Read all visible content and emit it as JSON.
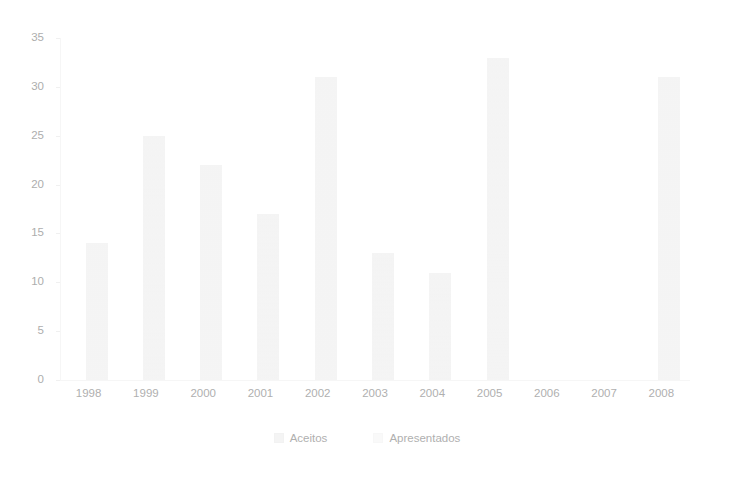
{
  "chart_data": {
    "type": "bar",
    "title": "",
    "subtitle": "",
    "xlabel": "",
    "ylabel": "",
    "categories": [
      "1998",
      "1999",
      "2000",
      "2001",
      "2002",
      "2003",
      "2004",
      "2005",
      "2006",
      "2007",
      "2008"
    ],
    "series": [
      {
        "name": "Aceitos",
        "color": "#f0f0f0",
        "values": [
          null,
          null,
          null,
          null,
          null,
          null,
          null,
          null,
          null,
          null,
          null
        ]
      },
      {
        "name": "Apresentados",
        "color": "#f4f4f4",
        "values": [
          14,
          25,
          22,
          17,
          31,
          13,
          11,
          33,
          0,
          0,
          31
        ]
      }
    ],
    "yticks": [
      0,
      5,
      10,
      15,
      20,
      25,
      30,
      35
    ],
    "ylim": [
      0,
      35
    ],
    "grid": false,
    "legend_position": "bottom"
  },
  "axes": {
    "y_tick_labels": [
      "35",
      "30",
      "25",
      "20",
      "15",
      "10",
      "5",
      "0"
    ],
    "x_tick_labels": [
      "1998",
      "1999",
      "2000",
      "2001",
      "2002",
      "2003",
      "2004",
      "2005",
      "2006",
      "2007",
      "2008"
    ]
  },
  "legend": {
    "items": [
      {
        "label": "Aceitos"
      },
      {
        "label": "Apresentados"
      }
    ]
  }
}
